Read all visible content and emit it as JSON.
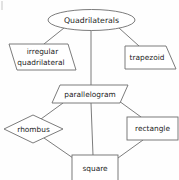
{
  "diagram": {
    "type": "hierarchy-tree",
    "theme": {
      "background": "#fefefe",
      "stroke": "#6d6d6d",
      "shape_fill": "#ffffff",
      "text": "#1c1c1c"
    },
    "nodes": [
      {
        "id": "quadrilaterals",
        "label": "Quadrilaterals",
        "shape": "ellipse",
        "level": 0,
        "cx": 91.5,
        "cy": 20,
        "rx": 43.5,
        "ry": 10.5
      },
      {
        "id": "irregular-quadrilateral",
        "label_line1": "irregular",
        "label_line2": "quadrilateral",
        "label": "irregular quadrilateral",
        "shape": "parallelogram",
        "level": 1,
        "cx": 42,
        "cy": 57
      },
      {
        "id": "trapezoid",
        "label": "trapezoid",
        "shape": "trapezoid",
        "level": 1,
        "cx": 148,
        "cy": 57.5
      },
      {
        "id": "parallelogram",
        "label": "parallelogram",
        "shape": "parallelogram",
        "level": 1,
        "cx": 90,
        "cy": 94
      },
      {
        "id": "rhombus",
        "label": "rhombus",
        "shape": "rhombus",
        "level": 2,
        "cx": 33.5,
        "cy": 129
      },
      {
        "id": "rectangle",
        "label": "rectangle",
        "shape": "rectangle",
        "level": 2,
        "cx": 152.5,
        "cy": 128.5
      },
      {
        "id": "square",
        "label": "square",
        "shape": "square",
        "level": 3,
        "cx": 95,
        "cy": 168
      }
    ],
    "edges": [
      {
        "from": "quadrilaterals",
        "to": "irregular-quadrilateral"
      },
      {
        "from": "quadrilaterals",
        "to": "parallelogram"
      },
      {
        "from": "quadrilaterals",
        "to": "trapezoid"
      },
      {
        "from": "parallelogram",
        "to": "rhombus"
      },
      {
        "from": "parallelogram",
        "to": "square"
      },
      {
        "from": "parallelogram",
        "to": "rectangle"
      },
      {
        "from": "rhombus",
        "to": "square"
      },
      {
        "from": "rectangle",
        "to": "square"
      }
    ]
  }
}
